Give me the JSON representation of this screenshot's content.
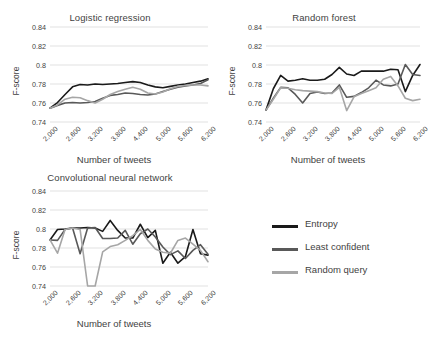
{
  "figure": {
    "background": "#ffffff",
    "text_color": "#3f3f3f"
  },
  "legend": {
    "position": "bottom-right",
    "entries": [
      {
        "label": "Entropy",
        "color": "#1a1a1a"
      },
      {
        "label": "Least confident",
        "color": "#595959"
      },
      {
        "label": "Random query",
        "color": "#a6a6a6"
      }
    ]
  },
  "chart_data": [
    {
      "type": "line",
      "title": "Logistic regression",
      "xlabel": "Number of tweets",
      "ylabel": "F-score",
      "ylim": [
        0.74,
        0.84
      ],
      "yticks": [
        0.74,
        0.76,
        0.78,
        0.8,
        0.82,
        0.84
      ],
      "ytick_labels": [
        "0.74",
        "0.76",
        "0.78",
        "0.8",
        "0.82",
        "0.84"
      ],
      "xlim": [
        2000,
        6200
      ],
      "xticks": [
        2000,
        2600,
        3200,
        3800,
        4400,
        5000,
        5600,
        6200
      ],
      "xtick_labels": [
        "2,000",
        "2,600",
        "3,200",
        "3,800",
        "4,400",
        "5,000",
        "5,600",
        "6,200"
      ],
      "x": [
        2000,
        2200,
        2400,
        2600,
        2800,
        3000,
        3200,
        3400,
        3600,
        3800,
        4000,
        4200,
        4400,
        4600,
        4800,
        5000,
        5200,
        5400,
        5600,
        5800,
        6000,
        6200
      ],
      "grid": true,
      "legend_position": "external",
      "series": [
        {
          "name": "Entropy",
          "color": "#1a1a1a",
          "values": [
            0.7545,
            0.7605,
            0.769,
            0.777,
            0.7795,
            0.779,
            0.78,
            0.7795,
            0.78,
            0.7805,
            0.7815,
            0.7825,
            0.7815,
            0.779,
            0.777,
            0.776,
            0.7775,
            0.779,
            0.78,
            0.7815,
            0.783,
            0.7855
          ]
        },
        {
          "name": "Least confident",
          "color": "#595959",
          "values": [
            0.7545,
            0.7575,
            0.76,
            0.7605,
            0.76,
            0.7605,
            0.7615,
            0.765,
            0.768,
            0.769,
            0.7705,
            0.77,
            0.769,
            0.7685,
            0.7695,
            0.772,
            0.7745,
            0.7765,
            0.778,
            0.779,
            0.7805,
            0.7845
          ]
        },
        {
          "name": "Random query",
          "color": "#a6a6a6",
          "values": [
            0.7545,
            0.758,
            0.764,
            0.766,
            0.7655,
            0.7625,
            0.76,
            0.764,
            0.769,
            0.772,
            0.7745,
            0.7765,
            0.7745,
            0.7705,
            0.7695,
            0.7715,
            0.775,
            0.7775,
            0.7785,
            0.779,
            0.779,
            0.778
          ]
        }
      ]
    },
    {
      "type": "line",
      "title": "Random forest",
      "xlabel": "Number of tweets",
      "ylabel": "F-score",
      "ylim": [
        0.74,
        0.84
      ],
      "yticks": [
        0.74,
        0.76,
        0.78,
        0.8,
        0.82,
        0.84
      ],
      "ytick_labels": [
        "0.74",
        "0.76",
        "0.78",
        "0.8",
        "0.82",
        "0.84"
      ],
      "xlim": [
        2000,
        6200
      ],
      "xticks": [
        2000,
        2600,
        3200,
        3800,
        4400,
        5000,
        5600,
        6200
      ],
      "xtick_labels": [
        "2,000",
        "2,600",
        "3,200",
        "3,800",
        "4,400",
        "5,000",
        "5,600",
        "6,200"
      ],
      "x": [
        2000,
        2200,
        2400,
        2600,
        2800,
        3000,
        3200,
        3400,
        3600,
        3800,
        4000,
        4200,
        4400,
        4600,
        4800,
        5000,
        5200,
        5400,
        5600,
        5800,
        6000,
        6200
      ],
      "grid": true,
      "legend_position": "external",
      "series": [
        {
          "name": "Entropy",
          "color": "#1a1a1a",
          "values": [
            0.7525,
            0.775,
            0.789,
            0.783,
            0.784,
            0.7855,
            0.784,
            0.784,
            0.785,
            0.79,
            0.7975,
            0.7905,
            0.789,
            0.7935,
            0.7935,
            0.7935,
            0.7935,
            0.7955,
            0.795,
            0.772,
            0.789,
            0.8005
          ]
        },
        {
          "name": "Least confident",
          "color": "#595959",
          "values": [
            0.7525,
            0.765,
            0.7765,
            0.776,
            0.769,
            0.76,
            0.77,
            0.7715,
            0.77,
            0.7705,
            0.779,
            0.766,
            0.767,
            0.771,
            0.776,
            0.784,
            0.779,
            0.778,
            0.78,
            0.8005,
            0.79,
            0.789
          ]
        },
        {
          "name": "Random query",
          "color": "#a6a6a6",
          "values": [
            0.7525,
            0.764,
            0.776,
            0.7755,
            0.774,
            0.773,
            0.7725,
            0.772,
            0.7705,
            0.77,
            0.7765,
            0.752,
            0.7665,
            0.77,
            0.773,
            0.776,
            0.785,
            0.788,
            0.778,
            0.765,
            0.7625,
            0.764
          ]
        }
      ]
    },
    {
      "type": "line",
      "title": "Convolutional neural network",
      "xlabel": "Number of tweets",
      "ylabel": "F-score",
      "ylim": [
        0.74,
        0.84
      ],
      "yticks": [
        0.74,
        0.76,
        0.78,
        0.8,
        0.82,
        0.84
      ],
      "ytick_labels": [
        "0.74",
        "0.76",
        "0.78",
        "0.8",
        "0.82",
        "0.84"
      ],
      "xlim": [
        2000,
        6200
      ],
      "xticks": [
        2000,
        2600,
        3200,
        3800,
        4400,
        5000,
        5600,
        6200
      ],
      "xtick_labels": [
        "2,000",
        "2,600",
        "3,200",
        "3,800",
        "4,400",
        "5,000",
        "5,600",
        "6,200"
      ],
      "x": [
        2000,
        2200,
        2400,
        2600,
        2800,
        3000,
        3200,
        3400,
        3600,
        3800,
        4000,
        4200,
        4400,
        4600,
        4800,
        5000,
        5200,
        5400,
        5600,
        5800,
        6000,
        6200
      ],
      "grid": true,
      "legend_position": "external",
      "series": [
        {
          "name": "Entropy",
          "color": "#1a1a1a",
          "values": [
            0.7885,
            0.7995,
            0.8,
            0.801,
            0.801,
            0.8015,
            0.801,
            0.7975,
            0.809,
            0.7985,
            0.7905,
            0.7905,
            0.805,
            0.791,
            0.7985,
            0.764,
            0.7755,
            0.764,
            0.771,
            0.7995,
            0.774,
            0.7725
          ]
        },
        {
          "name": "Least confident",
          "color": "#595959",
          "values": [
            0.7885,
            0.788,
            0.7995,
            0.801,
            0.774,
            0.801,
            0.8015,
            0.79,
            0.79,
            0.7905,
            0.7985,
            0.784,
            0.795,
            0.8,
            0.7915,
            0.781,
            0.773,
            0.777,
            0.769,
            0.7775,
            0.7835,
            0.7735
          ]
        },
        {
          "name": "Random query",
          "color": "#a6a6a6",
          "values": [
            0.7885,
            0.7745,
            0.7995,
            0.801,
            0.7995,
            0.74,
            0.74,
            0.776,
            0.7815,
            0.7835,
            0.788,
            0.793,
            0.7995,
            0.788,
            0.779,
            0.7755,
            0.7745,
            0.788,
            0.7905,
            0.784,
            0.7775,
            0.7655
          ]
        }
      ]
    }
  ]
}
